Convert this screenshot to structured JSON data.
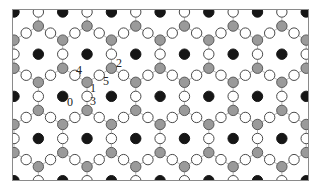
{
  "figure": {
    "atom_types": [
      {
        "name": "black",
        "color": "#161616"
      },
      {
        "name": "gray",
        "color": "#9a9a9a"
      },
      {
        "name": "white",
        "color": "#ffffff"
      }
    ],
    "site_labels": [
      "0",
      "1",
      "2",
      "3",
      "4",
      "5"
    ]
  }
}
